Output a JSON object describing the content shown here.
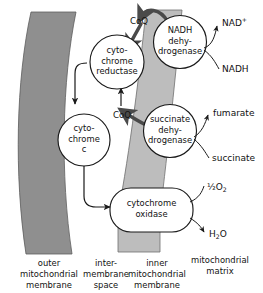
{
  "diagram": {
    "complexes": [
      {
        "id": "cytochrome-reductase",
        "line1": "cyto-",
        "line2": "chrome",
        "line3": "reductase"
      },
      {
        "id": "cytochrome-c",
        "line1": "cyto-",
        "line2": "chrome",
        "line3": "c"
      },
      {
        "id": "nadh-dehydrogenase",
        "line1": "NADH",
        "line2": "dehy-",
        "line3": "drogenase"
      },
      {
        "id": "succinate-dehydrogenase",
        "line1": "succinate",
        "line2": "dehy-",
        "line3": "drogenase"
      },
      {
        "id": "cytochrome-oxidase",
        "line1": "cytochrome",
        "line2": "oxidase"
      }
    ],
    "carriers": [
      {
        "id": "coq-top",
        "label": "CoQ"
      },
      {
        "id": "coq-mid",
        "label": "CoQ"
      }
    ],
    "substrates": {
      "nad_plus_base": "NAD",
      "nad_plus_sup": "+",
      "nadh": "NADH",
      "fumarate": "fumarate",
      "succinate": "succinate",
      "half_oxygen_frac": "½",
      "half_oxygen_base": "O",
      "half_oxygen_sub": "2",
      "water_h": "H",
      "water_sub": "2",
      "water_o": "O"
    },
    "columns": [
      {
        "id": "outer-mitochondrial-membrane",
        "line1": "outer",
        "line2": "mitochondrial",
        "line3": "membrane"
      },
      {
        "id": "intermembrane-space",
        "line1": "inter-",
        "line2": "membrane",
        "line3": "space"
      },
      {
        "id": "inner-mitochondrial-membrane",
        "line1": "inner",
        "line2": "mitochondrial",
        "line3": "membrane"
      },
      {
        "id": "mitochondrial-matrix",
        "line1": "mitochondrial",
        "line2": "matrix",
        "line3": ""
      }
    ],
    "colors": {
      "outer_membrane": "#8f8f8f",
      "inner_membrane": "#bdbdbd",
      "stroke": "#1a1a1a",
      "background": "#ffffff"
    }
  }
}
